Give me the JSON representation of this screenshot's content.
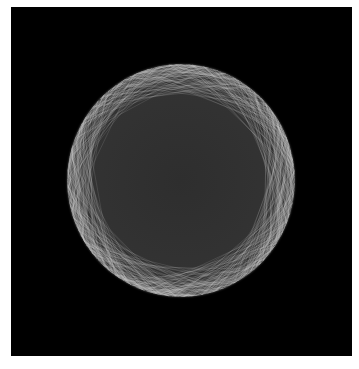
{
  "figure": {
    "background_color": "#000000",
    "sphere": {
      "description": "wireframe sphere of many random chords",
      "line_color": "#cfcfcf",
      "center": [
        180,
        180
      ],
      "radius": 115
    },
    "caption": " "
  }
}
